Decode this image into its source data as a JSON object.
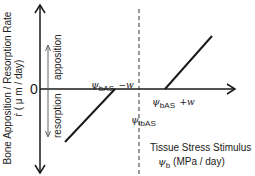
{
  "diagram": {
    "y_axis_label": {
      "line1": "Bone Apposition / Resorption Rate",
      "line2": "ṙ ( μ m / day)"
    },
    "origin_label": "0",
    "apposition_label": "apposition",
    "resorption_label": "resorption",
    "lower_threshold": {
      "symbol": "ψ",
      "subscript": "bAS",
      "suffix": "−w"
    },
    "upper_threshold": {
      "symbol": "ψ",
      "subscript": "bAS",
      "suffix": "+w"
    },
    "reference_stimulus": {
      "symbol": "ψ",
      "subscript": "ibAS"
    },
    "x_axis_label": {
      "line1": "Tissue Stress Stimulus",
      "symbol": "ψ",
      "subscript": "b",
      "unit": "(MPa / day)"
    },
    "line_color": "#1a1a1a"
  }
}
